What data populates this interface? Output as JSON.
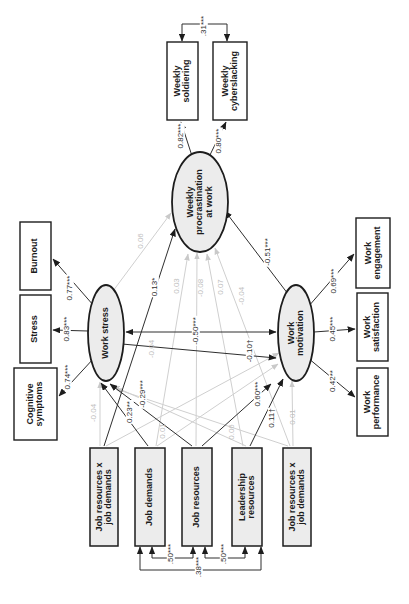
{
  "figure": {
    "type": "sem-path-diagram",
    "orientation": "rotated-90-ccw",
    "colors": {
      "significant_line": "#2e2e2e",
      "nonsignificant_line": "#cfcfcf",
      "node_fill": "#ececec",
      "indicator_fill": "#ffffff",
      "border": "#1d1d1d",
      "nonsignificant_text": "#bfbfbf"
    },
    "nodes": {
      "procrastination": {
        "label": "Weekly\nprocrastination\nat work",
        "kind": "latent"
      },
      "work_stress": {
        "label": "Work stress",
        "kind": "latent"
      },
      "work_motivation": {
        "label": "Work\nmotivation",
        "kind": "latent"
      },
      "soldiering": {
        "label": "Weekly\nsoldiering",
        "kind": "indicator"
      },
      "cyberslacking": {
        "label": "Weekly\ncyberslacking",
        "kind": "indicator"
      },
      "burnout": {
        "label": "Burnout",
        "kind": "indicator"
      },
      "stress": {
        "label": "Stress",
        "kind": "indicator"
      },
      "cognitive": {
        "label": "Cognitive\nsymptoms",
        "kind": "indicator"
      },
      "engagement": {
        "label": "Work\nengagement",
        "kind": "indicator"
      },
      "satisfaction": {
        "label": "Work\nsatisfaction",
        "kind": "indicator"
      },
      "performance": {
        "label": "Work\nperformance",
        "kind": "indicator"
      },
      "jrxjd1": {
        "label": "Job resources x\njob demands",
        "kind": "predictor"
      },
      "job_demands": {
        "label": "Job demands",
        "kind": "predictor"
      },
      "job_resources": {
        "label": "Job resources",
        "kind": "predictor"
      },
      "leadership": {
        "label": "Leadership\nresources",
        "kind": "predictor"
      },
      "jrxjd2": {
        "label": "Job resources x\njob demands",
        "kind": "predictor"
      }
    },
    "coeffs": {
      "procr_soldiering": "0.82***",
      "procr_cyberslacking": "0.80***",
      "sold_cyber_cov": ".31***",
      "stress_burnout": "0.77***",
      "stress_stressbox": "0.83***",
      "stress_cognitive": "0.74***",
      "motiv_engagement": "0.69***",
      "motiv_satisfaction": "0.45***",
      "motiv_performance": "0.42**",
      "motiv_procr": "-0.51***",
      "stress_motiv_cov": "-0.50***",
      "stress_motiv_path": "-0.10†",
      "jrxjd1_procr": "0.13*",
      "jd_stress": "0.23**",
      "jr_stress": "-0.29***",
      "jr_motiv": "0.60***",
      "lr_motiv": "0.11†",
      "jd_jr_cov": ".50***",
      "jr_lr_cov": ".50***",
      "jd_lr_cov": ".38***",
      "stress_procr": "0.06",
      "jd_procr": "0.03",
      "jr_procr": "-0.08",
      "lr_procr": "0.07",
      "jrxjd2_procr": "-0.04",
      "jrxjd1_motiv": "-0.04",
      "jrxjd1_stress": "-0.04",
      "jd_motiv": "0.01",
      "lr_stress": "0.06",
      "jrxjd2_motiv": "0.01"
    }
  }
}
